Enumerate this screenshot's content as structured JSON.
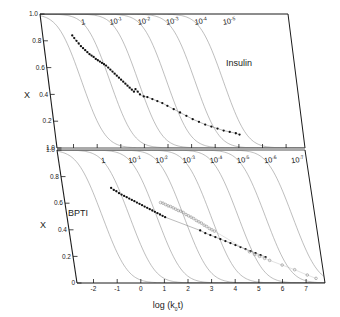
{
  "figure": {
    "title": "",
    "background": "#ffffff",
    "axis_color": "#1a1a1a",
    "curve_color": "#9a9a9a",
    "data_color_filled": "#111111",
    "data_color_open": "#8c8c8c"
  },
  "axes": {
    "x_label_main": "log (k",
    "x_label_sub": "0",
    "x_label_tail": "t)",
    "y_label": "X",
    "x_ticks": [
      "-2",
      "-1",
      "0",
      "1",
      "2",
      "3",
      "4",
      "5",
      "6",
      "7"
    ],
    "y_ticks_top": [
      "1.0",
      "0.8",
      "0.6",
      "0.4",
      "0.2",
      "1.0"
    ],
    "y_ticks_bottom": [
      "1.0",
      "0.8",
      "0.6",
      "0.4",
      "0.2",
      "0"
    ]
  },
  "panels": [
    {
      "name": "Insulin",
      "label": "Insulin",
      "curve_labels": [
        "1",
        "10",
        "10",
        "10",
        "10",
        "10"
      ],
      "curve_exponents": [
        "",
        "-1",
        "-2",
        "-3",
        "-4",
        "-5"
      ]
    },
    {
      "name": "BPTI",
      "label": "BPTI",
      "curve_labels": [
        "1",
        "10",
        "10",
        "10",
        "10",
        "10",
        "10",
        "10"
      ],
      "curve_exponents": [
        "",
        "-1",
        "-2",
        "-3",
        "-4",
        "-5",
        "-6",
        "-7"
      ]
    }
  ],
  "chart_data": {
    "type": "line",
    "title": "",
    "xlabel": "log (k0t)",
    "ylabel": "X",
    "xlim": [
      -2.7,
      7.8
    ],
    "ylim": [
      0,
      1.0
    ],
    "grid": false,
    "legend": "none",
    "subplots": [
      {
        "panel": "Insulin",
        "annotation": "Insulin",
        "theory_curves": [
          {
            "name": "1",
            "c": 1,
            "log10c": 0,
            "midpoint_x": -1.3
          },
          {
            "name": "10^-1",
            "c": 0.1,
            "log10c": -1,
            "midpoint_x": -0.1
          },
          {
            "name": "10^-2",
            "c": 0.01,
            "log10c": -2,
            "midpoint_x": 1.1
          },
          {
            "name": "10^-3",
            "c": 0.001,
            "log10c": -3,
            "midpoint_x": 2.3
          },
          {
            "name": "10^-4",
            "c": 0.0001,
            "log10c": -4,
            "midpoint_x": 3.5
          },
          {
            "name": "10^-5",
            "c": 1e-05,
            "log10c": -5,
            "midpoint_x": 4.7
          }
        ],
        "series": [
          {
            "name": "Insulin data",
            "marker": "filled-circle",
            "x": [
              -1.45,
              -1.38,
              -1.3,
              -1.22,
              -1.14,
              -1.06,
              -0.98,
              -0.9,
              -0.82,
              -0.74,
              -0.66,
              -0.58,
              -0.5,
              -0.42,
              -0.34,
              -0.26,
              -0.18,
              -0.1,
              -0.02,
              0.06,
              0.14,
              0.22,
              0.3,
              0.38,
              0.46,
              0.54,
              0.62,
              0.7,
              0.78,
              0.86,
              0.94,
              1.02,
              1.1,
              1.25,
              1.4,
              1.6,
              1.8,
              2.0,
              2.2,
              2.45,
              2.7,
              2.95,
              3.2,
              3.45,
              3.7,
              3.95,
              4.2,
              4.45,
              4.7,
              4.95,
              5.1
            ],
            "y": [
              0.84,
              0.82,
              0.8,
              0.78,
              0.76,
              0.745,
              0.73,
              0.715,
              0.7,
              0.69,
              0.68,
              0.665,
              0.655,
              0.645,
              0.635,
              0.625,
              0.615,
              0.6,
              0.585,
              0.57,
              0.555,
              0.54,
              0.525,
              0.51,
              0.495,
              0.48,
              0.465,
              0.45,
              0.435,
              0.42,
              0.44,
              0.42,
              0.4,
              0.385,
              0.38,
              0.365,
              0.35,
              0.335,
              0.315,
              0.29,
              0.265,
              0.24,
              0.215,
              0.195,
              0.175,
              0.16,
              0.145,
              0.13,
              0.12,
              0.11,
              0.1
            ]
          }
        ]
      },
      {
        "panel": "BPTI",
        "annotation": "BPTI",
        "theory_curves": [
          {
            "name": "1",
            "c": 1,
            "log10c": 0,
            "midpoint_x": -1.2
          },
          {
            "name": "10^-1",
            "c": 0.1,
            "log10c": -1,
            "midpoint_x": -0.05
          },
          {
            "name": "10^-2",
            "c": 0.01,
            "log10c": -2,
            "midpoint_x": 1.1
          },
          {
            "name": "10^-3",
            "c": 0.001,
            "log10c": -3,
            "midpoint_x": 2.25
          },
          {
            "name": "10^-4",
            "c": 0.0001,
            "log10c": -4,
            "midpoint_x": 3.4
          },
          {
            "name": "10^-5",
            "c": 1e-05,
            "log10c": -5,
            "midpoint_x": 4.55
          },
          {
            "name": "10^-6",
            "c": 1e-06,
            "log10c": -6,
            "midpoint_x": 5.7
          },
          {
            "name": "10^-7",
            "c": 1e-07,
            "log10c": -7,
            "midpoint_x": 6.85
          }
        ],
        "series": [
          {
            "name": "BPTI data filled",
            "marker": "filled-circle",
            "x": [
              -0.65,
              -0.55,
              -0.45,
              -0.35,
              -0.25,
              -0.15,
              -0.05,
              0.05,
              0.15,
              0.25,
              0.35,
              0.45,
              0.55,
              0.65,
              0.75,
              0.85,
              0.95,
              1.05,
              1.15,
              1.25,
              1.35,
              1.45,
              2.85,
              3.05,
              3.25,
              3.45,
              3.65,
              3.85,
              4.05,
              4.25,
              4.45,
              4.65,
              4.85,
              5.05,
              5.25,
              5.45
            ],
            "y": [
              0.715,
              0.7,
              0.69,
              0.675,
              0.665,
              0.655,
              0.645,
              0.635,
              0.625,
              0.615,
              0.605,
              0.595,
              0.585,
              0.575,
              0.565,
              0.555,
              0.545,
              0.535,
              0.525,
              0.515,
              0.505,
              0.495,
              0.395,
              0.375,
              0.36,
              0.345,
              0.33,
              0.315,
              0.3,
              0.285,
              0.27,
              0.255,
              0.24,
              0.225,
              0.21,
              0.195
            ]
          },
          {
            "name": "BPTI data open",
            "marker": "open-circle",
            "x": [
              1.35,
              1.45,
              1.55,
              1.65,
              1.75,
              1.85,
              1.95,
              2.05,
              2.15,
              2.25,
              2.35,
              2.45,
              2.55,
              2.65,
              2.75,
              2.85,
              2.95,
              3.05,
              3.15,
              3.25,
              3.35,
              3.45,
              4.8,
              5.0,
              5.2,
              5.4,
              5.6,
              6.1,
              6.6,
              7.1,
              7.45
            ],
            "y": [
              0.605,
              0.6,
              0.59,
              0.58,
              0.575,
              0.565,
              0.555,
              0.545,
              0.54,
              0.53,
              0.515,
              0.505,
              0.495,
              0.485,
              0.47,
              0.46,
              0.45,
              0.435,
              0.425,
              0.41,
              0.4,
              0.39,
              0.235,
              0.215,
              0.2,
              0.185,
              0.17,
              0.135,
              0.1,
              0.06,
              0.035
            ]
          }
        ]
      }
    ]
  }
}
